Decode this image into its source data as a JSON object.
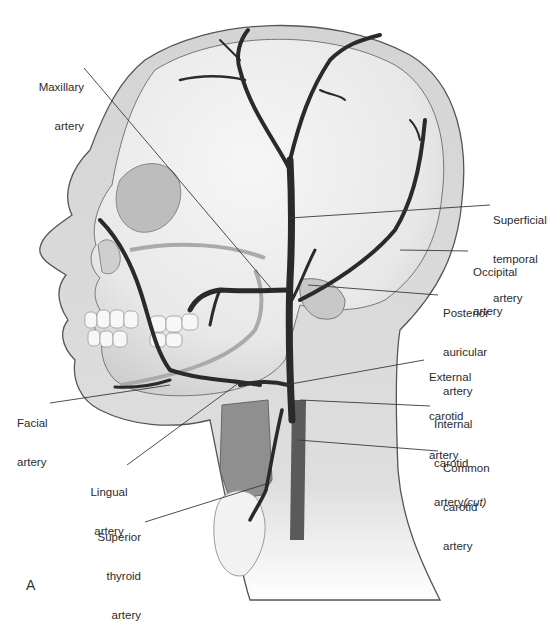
{
  "figure": {
    "panel_letter": "A",
    "colors": {
      "artery": "#2a2a2a",
      "skin": "#cfcfcf",
      "skull": "#ececec",
      "leader_line": "#3a3a3a",
      "text": "#2b2b2b"
    }
  },
  "labels": [
    {
      "id": "maxillary",
      "lines": [
        "Maxillary",
        "artery"
      ],
      "x": 38,
      "y": 55,
      "align": "right",
      "target": [
        275,
        293
      ],
      "anchor": [
        80,
        68
      ]
    },
    {
      "id": "superficial-temporal",
      "lines": [
        "Superficial",
        "temporal",
        "artery"
      ],
      "x": 493,
      "y": 188,
      "align": "left",
      "target": [
        290,
        218
      ],
      "anchor": [
        490,
        205
      ]
    },
    {
      "id": "occipital",
      "lines": [
        "Occipital",
        "artery"
      ],
      "x": 473,
      "y": 240,
      "align": "left",
      "target": [
        400,
        250
      ],
      "anchor": [
        468,
        251
      ]
    },
    {
      "id": "posterior-auricular",
      "lines": [
        "Posterior",
        "auricular",
        "artery"
      ],
      "x": 443,
      "y": 281,
      "align": "left",
      "target": [
        308,
        285
      ],
      "anchor": [
        438,
        295
      ]
    },
    {
      "id": "external-carotid",
      "lines": [
        "External",
        "carotid",
        "artery"
      ],
      "x": 429,
      "y": 345,
      "align": "left",
      "target": [
        285,
        385
      ],
      "anchor": [
        424,
        360
      ]
    },
    {
      "id": "internal-carotid",
      "lines": [
        "Internal",
        "carotid",
        "artery"
      ],
      "italic_suffix": "(cut)",
      "x": 434,
      "y": 392,
      "align": "left",
      "target": [
        300,
        400
      ],
      "anchor": [
        430,
        406
      ]
    },
    {
      "id": "common-carotid",
      "lines": [
        "Common",
        "carotid",
        "artery"
      ],
      "x": 443,
      "y": 436,
      "align": "left",
      "target": [
        298,
        440
      ],
      "anchor": [
        438,
        451
      ]
    },
    {
      "id": "facial",
      "lines": [
        "Facial",
        "artery"
      ],
      "x": 17,
      "y": 391,
      "align": "left",
      "target": [
        170,
        385
      ],
      "anchor": [
        50,
        403
      ]
    },
    {
      "id": "lingual",
      "lines": [
        "Lingual",
        "artery"
      ],
      "x": 88,
      "y": 460,
      "align": "center",
      "target": [
        240,
        382
      ],
      "anchor": [
        127,
        465
      ]
    },
    {
      "id": "superior-thyroid",
      "lines": [
        "Superior",
        "thyroid",
        "artery"
      ],
      "x": 97,
      "y": 505,
      "align": "right",
      "target": [
        266,
        484
      ],
      "anchor": [
        145,
        522
      ]
    }
  ]
}
